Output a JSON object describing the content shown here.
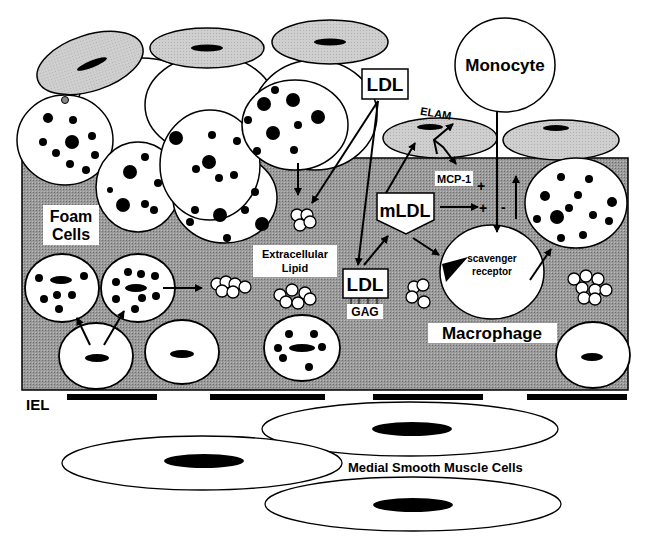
{
  "labels": {
    "monocyte": "Monocyte",
    "ldl_top": "LDL",
    "elam": "ELAM",
    "mcp1": "MCP-1",
    "plus1": "+",
    "plus2": "+",
    "minus": "-",
    "mldl": "mLDL",
    "foam_cells_1": "Foam",
    "foam_cells_2": "Cells",
    "extracellular_1": "Extracellular",
    "extracellular_2": "Lipid",
    "ldl_bottom": "LDL",
    "gag": "GAG",
    "scavenger_1": "scavenger",
    "scavenger_2": "receptor",
    "macrophage": "Macrophage",
    "iel": "IEL",
    "medial": "Medial Smooth Muscle Cells"
  },
  "colors": {
    "intima": "#8c8c8c",
    "endothelium": "#c8c8c8",
    "cell": "#ffffff",
    "ink": "#000000"
  }
}
